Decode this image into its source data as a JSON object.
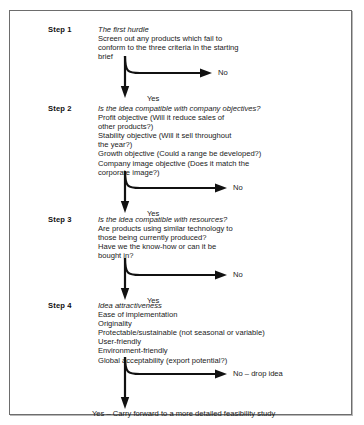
{
  "figure": {
    "type": "flowchart",
    "orientation": "vertical-decision-chain"
  },
  "steps": [
    {
      "label": "Step 1",
      "heading": "The first hurdle",
      "lines": [
        "Screen out any products which fail to",
        "conform to the three criteria in the starting",
        "brief"
      ]
    },
    {
      "label": "Step 2",
      "heading": "Is the idea compatible with company objectives?",
      "lines": [
        "Profit objective (Will it reduce sales of",
        "other products?)",
        "Stability objective (Will it sell throughout",
        "the year?)",
        "Growth objective (Could a range be developed?)",
        "Company image objective (Does it match the",
        "corporate image?)"
      ]
    },
    {
      "label": "Step 3",
      "heading": "Is the idea compatible with resources?",
      "lines": [
        "Are products using similar technology to",
        "those being currently produced?",
        "Have we the know-how or can it be",
        "bought in?"
      ]
    },
    {
      "label": "Step 4",
      "heading": "Idea attractiveness",
      "lines": [
        "Ease of implementation",
        "Originality",
        "Protectable/sustainable (not seasonal or variable)",
        "User-friendly",
        "Environment-friendly",
        "Global acceptability (export potential?)"
      ]
    }
  ],
  "decisions": [
    {
      "no_label": "No",
      "yes_label": "Yes"
    },
    {
      "no_label": "No",
      "yes_label": "Yes"
    },
    {
      "no_label": "No",
      "yes_label": "Yes"
    },
    {
      "no_label": "No – drop idea",
      "yes_label": ""
    }
  ],
  "final_outcome": "Yes – Carry forward to a more detailed feasibility study",
  "colors": {
    "line": "#111111",
    "text": "#1a1a1a",
    "frame_border": "#6d6d6d",
    "background": "#ffffff"
  }
}
